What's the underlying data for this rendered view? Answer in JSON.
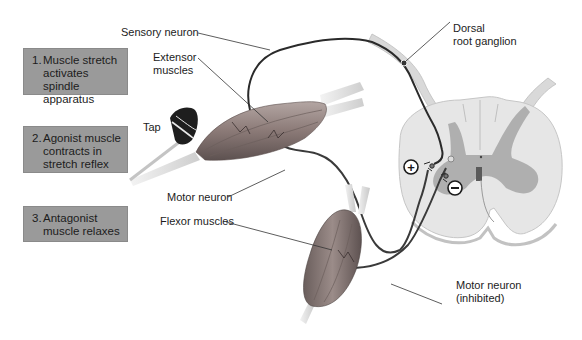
{
  "figure": {
    "steps": [
      {
        "number": "1.",
        "text": "Muscle stretch\nactivates spindle\napparatus"
      },
      {
        "number": "2.",
        "text": "Agonist muscle\ncontracts in\nstretch reflex"
      },
      {
        "number": "3.",
        "text": "Antagonist\nmuscle relaxes"
      }
    ],
    "labels": {
      "sensory_neuron": "Sensory neuron",
      "extensor_muscles": "Extensor\nmuscles",
      "tap": "Tap",
      "motor_neuron": "Motor neuron",
      "flexor_muscles": "Flexor muscles",
      "dorsal_root_ganglion": "Dorsal\nroot ganglion",
      "motor_neuron_inhibited": "Motor neuron\n(inhibited)",
      "excitatory_symbol": "+",
      "inhibitory_symbol": "−"
    },
    "colors": {
      "step_box": "#9a9a9a",
      "neuron": "#2a2a2a",
      "spinal_white_matter": "#e6e6e6",
      "spinal_gray_matter": "#a8a8a8",
      "muscle": "#8a7a78"
    }
  }
}
